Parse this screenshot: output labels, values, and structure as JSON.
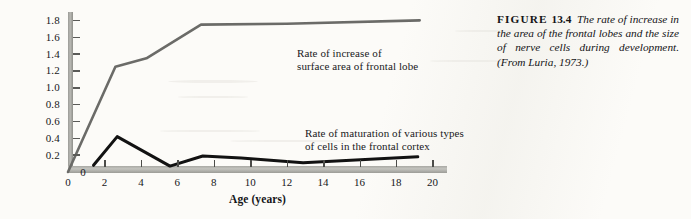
{
  "caption": {
    "figure_label": "FIGURE",
    "figure_number": "13.4",
    "text": "The rate of increase in the area of the frontal lobes and the size of nerve cells during development. (From Luria, 1973.)"
  },
  "annotations": {
    "gray_line_line1": "Rate of increase of",
    "gray_line_line2": "surface area of frontal lobe",
    "black_line_line1": "Rate of maturation of various types",
    "black_line_line2": "of cells in the frontal cortex"
  },
  "colors": {
    "gray_series": "#6b6b68",
    "black_series": "#121212",
    "axis_band": "#b0b0ab",
    "paper": "#fcfbf8"
  },
  "chart_data": {
    "type": "line",
    "title": "",
    "xlabel": "Age (years)",
    "ylabel": "Rate of increase (percent)",
    "xlim": [
      0,
      20.8
    ],
    "ylim": [
      0,
      1.9
    ],
    "xticks": [
      "0",
      "2",
      "4",
      "6",
      "8",
      "10",
      "12",
      "14",
      "16",
      "18",
      "20"
    ],
    "xtick_values": [
      0,
      2,
      4,
      6,
      8,
      10,
      12,
      14,
      16,
      18,
      20
    ],
    "yticks": [
      "0",
      "0.2",
      "0.4",
      "0.6",
      "0.8",
      "1.0",
      "1.2",
      "1.4",
      "1.6",
      "1.8"
    ],
    "ytick_values": [
      0,
      0.2,
      0.4,
      0.6,
      0.8,
      1.0,
      1.2,
      1.4,
      1.6,
      1.8
    ],
    "grid": false,
    "legend": "in-plot annotations",
    "series": [
      {
        "name": "Rate of increase of surface area of frontal lobe",
        "color": "#6b6b68",
        "width": 2.6,
        "points": [
          [
            0.0,
            0.0
          ],
          [
            2.6,
            1.25
          ],
          [
            4.3,
            1.35
          ],
          [
            7.3,
            1.75
          ],
          [
            12.0,
            1.76
          ],
          [
            19.3,
            1.8
          ]
        ]
      },
      {
        "name": "Rate of maturation of various types of cells in the frontal cortex",
        "color": "#121212",
        "width": 3.0,
        "points": [
          [
            1.4,
            0.08
          ],
          [
            2.7,
            0.42
          ],
          [
            5.6,
            0.07
          ],
          [
            7.4,
            0.19
          ],
          [
            9.5,
            0.165
          ],
          [
            12.9,
            0.11
          ],
          [
            19.2,
            0.18
          ]
        ]
      }
    ]
  }
}
